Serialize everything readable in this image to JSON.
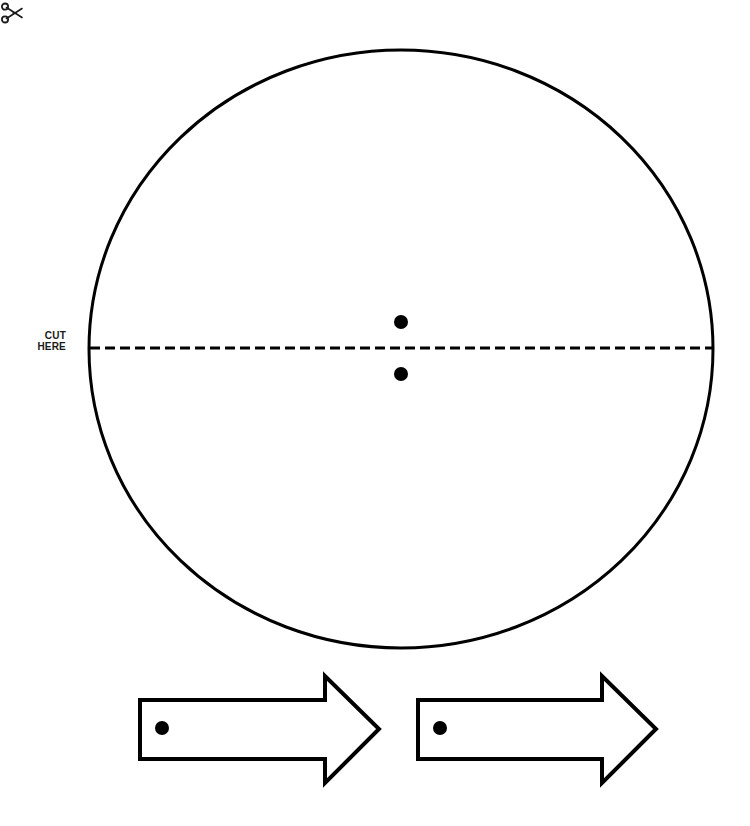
{
  "page": {
    "background_color": "#ffffff",
    "ink_color": "#000000",
    "width": 750,
    "height": 826
  },
  "cut_guide": {
    "label_line_1": "CUT",
    "label_line_2": "HERE",
    "icon": "scissors-icon",
    "line_style": "dashed",
    "dash_length": 10,
    "dash_gap": 5,
    "line_y": 348,
    "line_x_start": 90,
    "line_x_end": 713,
    "stroke_width": 3,
    "color": "#000000"
  },
  "shapes": {
    "circle": {
      "name": "circle-outline",
      "center_x": 401,
      "center_y": 349,
      "radius_x": 312,
      "radius_y": 299,
      "stroke_width": 3,
      "fill": "none",
      "stroke": "#000000"
    },
    "center_dots": [
      {
        "name": "dot-upper",
        "cx": 401,
        "cy": 322,
        "r": 7,
        "fill": "#000000"
      },
      {
        "name": "dot-lower",
        "cx": 401,
        "cy": 374,
        "r": 7,
        "fill": "#000000"
      }
    ],
    "arrows": [
      {
        "name": "arrow-left",
        "direction": "right",
        "shaft_left": 140,
        "shaft_top": 700,
        "shaft_bottom": 759,
        "head_left": 325,
        "head_top": 676,
        "head_bottom": 783,
        "tip_x": 379,
        "tip_y": 729,
        "stroke_width": 4,
        "fill": "#ffffff",
        "stroke": "#000000",
        "dot": {
          "name": "arrow-dot",
          "cx": 162,
          "cy": 728,
          "r": 7,
          "fill": "#000000"
        }
      },
      {
        "name": "arrow-right",
        "direction": "right",
        "shaft_left": 418,
        "shaft_top": 700,
        "shaft_bottom": 759,
        "head_left": 602,
        "head_top": 676,
        "head_bottom": 783,
        "tip_x": 656,
        "tip_y": 729,
        "stroke_width": 4,
        "fill": "#ffffff",
        "stroke": "#000000",
        "dot": {
          "name": "arrow-dot",
          "cx": 440,
          "cy": 728,
          "r": 7,
          "fill": "#000000"
        }
      }
    ]
  }
}
